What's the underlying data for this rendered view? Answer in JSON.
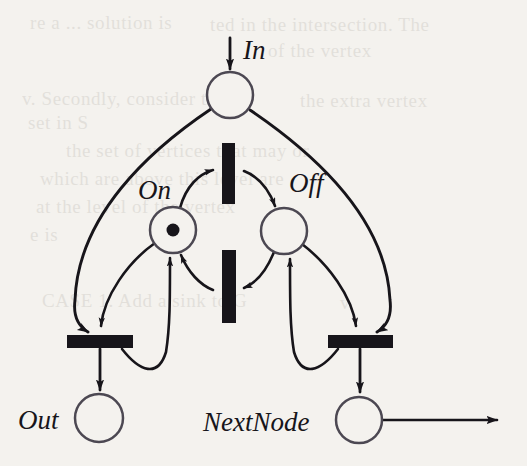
{
  "figure": {
    "kind": "petri-net",
    "title": "",
    "background_color": "#f4f2ee",
    "ink_color": "#17151a"
  },
  "labels": {
    "in": "In",
    "on": "On",
    "off": "Off",
    "out": "Out",
    "next_node": "NextNode"
  },
  "places": [
    {
      "id": "in",
      "label": "In",
      "cx": 230,
      "cy": 95,
      "r": 23,
      "tokens": 0
    },
    {
      "id": "on",
      "label": "On",
      "cx": 173,
      "cy": 230,
      "r": 23,
      "tokens": 1
    },
    {
      "id": "off",
      "label": "Off",
      "cx": 284,
      "cy": 231,
      "r": 23,
      "tokens": 0
    },
    {
      "id": "out",
      "label": "Out",
      "cx": 99,
      "cy": 418,
      "r": 24,
      "tokens": 0
    },
    {
      "id": "nextnode",
      "label": "NextNode",
      "cx": 359,
      "cy": 420,
      "r": 23,
      "tokens": 0
    }
  ],
  "transitions": [
    {
      "id": "t-on-to-off",
      "orientation": "vertical",
      "x": 222,
      "y": 143,
      "width": 13,
      "height": 61
    },
    {
      "id": "t-off-to-on",
      "orientation": "vertical",
      "x": 222,
      "y": 250,
      "width": 14,
      "height": 73
    },
    {
      "id": "t-out",
      "orientation": "horizontal",
      "x": 67,
      "y": 335,
      "width": 66,
      "height": 13
    },
    {
      "id": "t-next",
      "orientation": "horizontal",
      "x": 328,
      "y": 335,
      "width": 65,
      "height": 13
    }
  ],
  "arcs": [
    {
      "from": "external",
      "to": "in",
      "kind": "input-arrow"
    },
    {
      "from": "in",
      "to": "t-out",
      "kind": "curved"
    },
    {
      "from": "in",
      "to": "t-next",
      "kind": "curved"
    },
    {
      "from": "on",
      "to": "t-on-to-off",
      "kind": "curved"
    },
    {
      "from": "t-on-to-off",
      "to": "off",
      "kind": "curved"
    },
    {
      "from": "off",
      "to": "t-off-to-on",
      "kind": "curved"
    },
    {
      "from": "t-off-to-on",
      "to": "on",
      "kind": "curved"
    },
    {
      "from": "on",
      "to": "t-out",
      "kind": "curved"
    },
    {
      "from": "t-out",
      "to": "on",
      "kind": "curved"
    },
    {
      "from": "t-out",
      "to": "out",
      "kind": "straight"
    },
    {
      "from": "off",
      "to": "t-next",
      "kind": "curved"
    },
    {
      "from": "t-next",
      "to": "off",
      "kind": "curved"
    },
    {
      "from": "t-next",
      "to": "nextnode",
      "kind": "straight"
    },
    {
      "from": "nextnode",
      "to": "external",
      "kind": "output-arrow"
    }
  ],
  "ghost_text": [
    {
      "text": "re a ... solution is",
      "x": 30,
      "y": 12
    },
    {
      "text": "ted in the intersection. The",
      "x": 210,
      "y": 14
    },
    {
      "text": "of the vertex",
      "x": 268,
      "y": 40
    },
    {
      "text": "v. Secondly, consider the",
      "x": 22,
      "y": 88
    },
    {
      "text": "the extra vertex",
      "x": 300,
      "y": 90
    },
    {
      "text": "set in S",
      "x": 28,
      "y": 112
    },
    {
      "text": "the set of vertices that may or",
      "x": 66,
      "y": 140
    },
    {
      "text": "which are above this level are",
      "x": 40,
      "y": 168
    },
    {
      "text": "at the level of the vertex",
      "x": 36,
      "y": 196
    },
    {
      "text": "e is",
      "x": 30,
      "y": 224
    },
    {
      "text": "CASE 1. Add a sink to G",
      "x": 42,
      "y": 290
    },
    {
      "text": "v",
      "x": 340,
      "y": 292
    }
  ]
}
